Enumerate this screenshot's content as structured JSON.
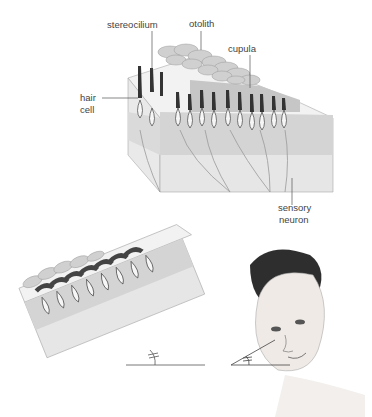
{
  "figure": {
    "top_panel": {
      "title": "Otolith organ cross-section",
      "labels": {
        "stereocilium": "stereocilium",
        "otolith": "otolith",
        "cupula": "cupula",
        "hair_cell_line1": "hair",
        "hair_cell_line2": "cell",
        "sensory_neuron_line1": "sensory",
        "sensory_neuron_line2": "neuron"
      }
    },
    "bottom_panel": {
      "left": "Tilted otolith organ block with angle marker",
      "right": "Head tilted with matching angle marker"
    },
    "colors": {
      "line": "#555555",
      "block_light": "#ececec",
      "block_mid": "#d6d6d6",
      "block_dark": "#c4c4c4",
      "hair": "#333333"
    }
  }
}
